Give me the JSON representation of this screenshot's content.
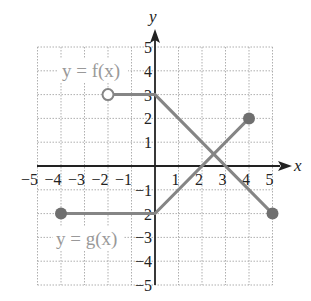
{
  "chart_data": {
    "type": "line",
    "title": "",
    "xlabel": "x",
    "ylabel": "y",
    "xlim": [
      -5,
      5
    ],
    "ylim": [
      -5,
      5
    ],
    "grid": true,
    "x_ticks": [
      "-5",
      "-4",
      "-3",
      "-2",
      "-1",
      "1",
      "2",
      "3",
      "4",
      "5"
    ],
    "y_ticks": [
      "5",
      "4",
      "3",
      "2",
      "1",
      "-1",
      "-2",
      "-3",
      "-4",
      "-5"
    ],
    "series": [
      {
        "name": "y = f(x)",
        "points": [
          [
            -2,
            3
          ],
          [
            0,
            3
          ],
          [
            5,
            -2
          ]
        ],
        "start_marker": "open",
        "end_marker": "closed",
        "color": "#858585"
      },
      {
        "name": "y = g(x)",
        "points": [
          [
            -4,
            -2
          ],
          [
            0,
            -2
          ],
          [
            4,
            2
          ]
        ],
        "start_marker": "closed",
        "end_marker": "closed",
        "color": "#858585"
      }
    ],
    "annotations": [
      {
        "text": "y = f(x)",
        "x": -3,
        "y": 4
      },
      {
        "text": "y = g(x)",
        "x": -3,
        "y": -3
      }
    ]
  },
  "labels": {
    "x_axis": "x",
    "y_axis": "y",
    "f_label": "y = f(x)",
    "g_label": "y = g(x)"
  }
}
